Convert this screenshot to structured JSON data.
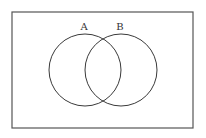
{
  "diagram": {
    "type": "venn",
    "universe": {
      "x": 12,
      "y": 12,
      "width": 181,
      "height": 116,
      "stroke": "#555555"
    },
    "sets": [
      {
        "label": "A",
        "cx": 85,
        "cy": 70,
        "r": 36,
        "label_x": 84,
        "label_y": 30
      },
      {
        "label": "B",
        "cx": 121,
        "cy": 70,
        "r": 36,
        "label_x": 120,
        "label_y": 30
      }
    ],
    "stroke_color": "#3a3a3a",
    "background": "#ffffff"
  }
}
